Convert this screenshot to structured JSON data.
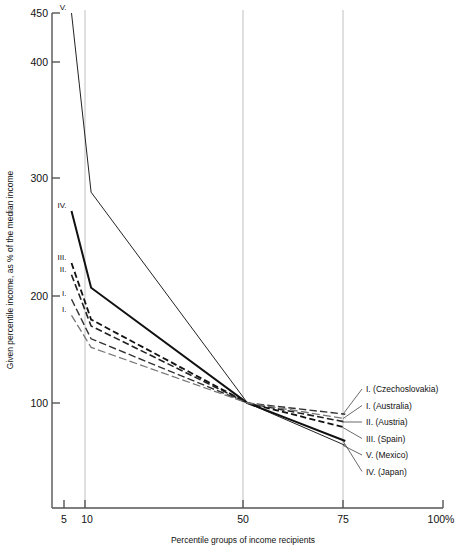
{
  "chart_data": {
    "type": "line",
    "title": "",
    "xlabel": "Percentile groups of income recipients",
    "ylabel": "Given percentile income, as % of the median income",
    "x_tick_labels": [
      "5",
      "10",
      "50",
      "75",
      "100%"
    ],
    "x_tick_values": [
      5,
      10,
      50,
      75,
      100
    ],
    "y_tick_labels": [
      "100",
      "200",
      "300",
      "400",
      "450"
    ],
    "y_tick_values": [
      100,
      200,
      300,
      400,
      450
    ],
    "ylim": [
      40,
      450
    ],
    "xlim": [
      0,
      100
    ],
    "grid": "vertical gridlines at 10, 50, 75",
    "gridlines_x": [
      10,
      50,
      75
    ],
    "legend_position": "right, inline with line ends at x=75",
    "x": [
      5,
      10,
      50,
      75
    ],
    "series": [
      {
        "name": "V. (Mexico)",
        "tag": "V.",
        "legend_label": "V. (Mexico)",
        "values": [
          450,
          288,
          100,
          62
        ],
        "style": "solid",
        "width": 1.0,
        "color": "#222222"
      },
      {
        "name": "IV. (Japan)",
        "tag": "IV.",
        "legend_label": "IV. (Japan)",
        "values": [
          272,
          207,
          100,
          66
        ],
        "style": "solid",
        "width": 2.0,
        "color": "#111111"
      },
      {
        "name": "III. (Spain)",
        "tag": "III.",
        "legend_label": "III. (Spain)",
        "values": [
          228,
          178,
          100,
          78
        ],
        "style": "dashed",
        "width": 1.8,
        "color": "#111111"
      },
      {
        "name": "II. (Austria)",
        "tag": "II.",
        "legend_label": "II. (Austria)",
        "values": [
          218,
          172,
          100,
          83
        ],
        "style": "dashed",
        "width": 1.6,
        "color": "#222222"
      },
      {
        "name": "I. (Czechoslovakia)",
        "tag": "I.",
        "legend_label": "I. (Czechoslovakia)",
        "values": [
          197,
          160,
          100,
          90
        ],
        "style": "dashed",
        "width": 1.4,
        "color": "#333333"
      },
      {
        "name": "I. (Australia)",
        "tag": "I.",
        "legend_label": "I. (Australia)",
        "values": [
          182,
          152,
          100,
          86
        ],
        "style": "dashed",
        "width": 1.3,
        "color": "#777777"
      }
    ]
  },
  "axes": {
    "y_label": "Given percentile income, as % of the median income",
    "x_label": "Percentile groups of income recipients",
    "y_ticks": [
      {
        "label": "450",
        "value": 450
      },
      {
        "label": "400",
        "value": 400
      },
      {
        "label": "300",
        "value": 300
      },
      {
        "label": "200",
        "value": 200
      },
      {
        "label": "100",
        "value": 100
      }
    ],
    "x_ticks": [
      {
        "label": "5",
        "value": 5
      },
      {
        "label": "10",
        "value": 10
      },
      {
        "label": "50",
        "value": 50
      },
      {
        "label": "75",
        "value": 75
      },
      {
        "label": "100%",
        "value": 100
      }
    ]
  },
  "curve_tags": [
    {
      "text": "V."
    },
    {
      "text": "IV."
    },
    {
      "text": "III."
    },
    {
      "text": "II."
    },
    {
      "text": "I."
    },
    {
      "text": "I."
    }
  ],
  "legend": {
    "entries": [
      {
        "label": "I. (Czechoslovakia)"
      },
      {
        "label": "I. (Australia)"
      },
      {
        "label": "II. (Austria)"
      },
      {
        "label": "III. (Spain)"
      },
      {
        "label": "V. (Mexico)"
      },
      {
        "label": "IV. (Japan)"
      }
    ]
  },
  "colors": {
    "axis": "#555555",
    "grid": "#bbbbbb",
    "text": "#111111"
  }
}
